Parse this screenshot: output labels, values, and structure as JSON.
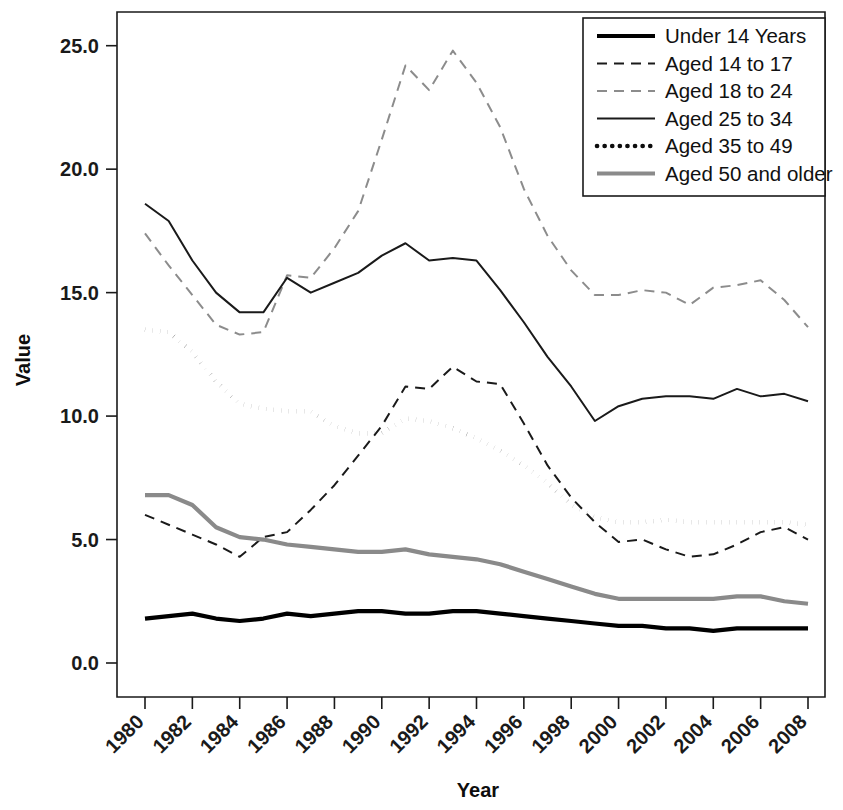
{
  "chart_data": {
    "type": "line",
    "title": "",
    "xlabel": "Year",
    "ylabel": "Value",
    "xlim": [
      1980,
      2008
    ],
    "ylim": [
      0.0,
      25.0
    ],
    "grid": false,
    "legend_position": "top-right",
    "x": [
      1980,
      1981,
      1982,
      1983,
      1984,
      1985,
      1986,
      1987,
      1988,
      1989,
      1990,
      1991,
      1992,
      1993,
      1994,
      1995,
      1996,
      1997,
      1998,
      1999,
      2000,
      2001,
      2002,
      2003,
      2004,
      2005,
      2006,
      2007,
      2008
    ],
    "xticklabels": [
      "1980",
      "1982",
      "1984",
      "1986",
      "1988",
      "1990",
      "1992",
      "1994",
      "1996",
      "1998",
      "2000",
      "2002",
      "2004",
      "2006",
      "2008"
    ],
    "yticklabels": [
      "0.0",
      "5.0",
      "10.0",
      "15.0",
      "20.0",
      "25.0"
    ],
    "series": [
      {
        "name": "Under 14 Years",
        "style": "solid-thick",
        "color": "#000000",
        "values": [
          1.8,
          1.9,
          2.0,
          1.8,
          1.7,
          1.8,
          2.0,
          1.9,
          2.0,
          2.1,
          2.1,
          2.0,
          2.0,
          2.1,
          2.1,
          2.0,
          1.9,
          1.8,
          1.7,
          1.6,
          1.5,
          1.5,
          1.4,
          1.4,
          1.3,
          1.4,
          1.4,
          1.4,
          1.4
        ]
      },
      {
        "name": "Aged 14 to 17",
        "style": "dashed",
        "color": "#1a1a1a",
        "values": [
          6.0,
          5.6,
          5.2,
          4.8,
          4.3,
          5.1,
          5.3,
          6.2,
          7.2,
          8.4,
          9.6,
          11.2,
          11.1,
          12.0,
          11.4,
          11.3,
          9.7,
          8.0,
          6.7,
          5.7,
          4.9,
          5.0,
          4.6,
          4.3,
          4.4,
          4.8,
          5.3,
          5.5,
          5.0
        ]
      },
      {
        "name": "Aged 18 to 24",
        "style": "dashed-light",
        "color": "#8c8c8c",
        "values": [
          17.4,
          16.1,
          14.9,
          13.7,
          13.3,
          13.4,
          15.7,
          15.6,
          16.8,
          18.3,
          21.2,
          24.2,
          23.2,
          24.8,
          23.5,
          21.7,
          19.2,
          17.3,
          15.9,
          14.9,
          14.9,
          15.1,
          15.0,
          14.5,
          15.2,
          15.3,
          15.5,
          14.7,
          13.6
        ]
      },
      {
        "name": "Aged 25 to 34",
        "style": "solid-thin",
        "color": "#1a1a1a",
        "values": [
          18.6,
          17.9,
          16.3,
          15.0,
          14.2,
          14.2,
          15.6,
          15.0,
          15.4,
          15.8,
          16.5,
          17.0,
          16.3,
          16.4,
          16.3,
          15.1,
          13.8,
          12.4,
          11.2,
          9.8,
          10.4,
          10.7,
          10.8,
          10.8,
          10.7,
          11.1,
          10.8,
          10.9,
          10.6
        ]
      },
      {
        "name": "Aged 35 to 49",
        "style": "dotted",
        "color": "#0d0d0d",
        "values": [
          13.5,
          13.4,
          12.6,
          11.4,
          10.5,
          10.3,
          10.2,
          10.2,
          9.6,
          9.3,
          9.3,
          9.9,
          9.8,
          9.5,
          9.1,
          8.6,
          8.0,
          7.3,
          6.4,
          5.9,
          5.7,
          5.7,
          5.8,
          5.7,
          5.7,
          5.7,
          5.7,
          5.7,
          5.6
        ]
      },
      {
        "name": "Aged 50 and older",
        "style": "solid-gray",
        "color": "#8a8a8a",
        "values": [
          6.8,
          6.8,
          6.4,
          5.5,
          5.1,
          5.0,
          4.8,
          4.7,
          4.6,
          4.5,
          4.5,
          4.6,
          4.4,
          4.3,
          4.2,
          4.0,
          3.7,
          3.4,
          3.1,
          2.8,
          2.6,
          2.6,
          2.6,
          2.6,
          2.6,
          2.7,
          2.7,
          2.5,
          2.4
        ]
      }
    ]
  },
  "axes": {
    "y_title": "Value",
    "x_title": "Year"
  },
  "legend": {
    "items": [
      {
        "label": "Under 14 Years"
      },
      {
        "label": "Aged 14 to 17"
      },
      {
        "label": "Aged 18 to 24"
      },
      {
        "label": "Aged 25 to 34"
      },
      {
        "label": "Aged 35 to 49"
      },
      {
        "label": "Aged 50 and older"
      }
    ]
  }
}
